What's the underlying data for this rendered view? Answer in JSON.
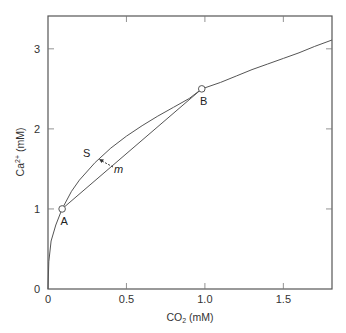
{
  "chart_data": {
    "type": "line",
    "title": "",
    "xlabel": "CO2 (mM)",
    "xlabel_main": "CO",
    "xlabel_sub": "2",
    "xlabel_rest": " (mM)",
    "ylabel": "Ca2+ (mM)",
    "ylabel_main": "Ca",
    "ylabel_sup": "2+",
    "ylabel_rest": " (mM)",
    "xlim": [
      0,
      1.81
    ],
    "ylim": [
      0,
      3.41
    ],
    "xticks": [
      {
        "value": 0,
        "label": "0"
      },
      {
        "value": 0.5,
        "label": "0.5"
      },
      {
        "value": 1.0,
        "label": "1.0"
      },
      {
        "value": 1.5,
        "label": "1.5"
      }
    ],
    "yticks": [
      {
        "value": 0,
        "label": "0"
      },
      {
        "value": 1,
        "label": "1"
      },
      {
        "value": 2,
        "label": "2"
      },
      {
        "value": 3,
        "label": "3"
      }
    ],
    "grid": false,
    "series": [
      {
        "name": "solubility curve",
        "x": [
          0,
          0.005,
          0.02,
          0.05,
          0.09,
          0.15,
          0.2,
          0.3,
          0.4,
          0.5,
          0.6,
          0.7,
          0.8,
          0.9,
          0.98,
          1.1,
          1.2,
          1.3,
          1.4,
          1.5,
          1.6,
          1.7,
          1.81
        ],
        "y": [
          0,
          0.34,
          0.6,
          0.8,
          1.0,
          1.22,
          1.36,
          1.58,
          1.76,
          1.91,
          2.04,
          2.16,
          2.27,
          2.38,
          2.5,
          2.58,
          2.66,
          2.74,
          2.81,
          2.88,
          2.95,
          3.03,
          3.11
        ]
      },
      {
        "name": "mixing line A-B",
        "x": [
          0.09,
          0.98
        ],
        "y": [
          1.0,
          2.5
        ]
      }
    ],
    "points": [
      {
        "label": "A",
        "x": 0.09,
        "y": 1.0
      },
      {
        "label": "B",
        "x": 0.98,
        "y": 2.5
      }
    ],
    "annotations": [
      {
        "text": "S",
        "x": 0.26,
        "y": 1.67
      },
      {
        "text": "m",
        "x": 0.43,
        "y": 1.47,
        "italic": true,
        "arrow_to": "S",
        "arrow_style": "dashed"
      }
    ]
  }
}
